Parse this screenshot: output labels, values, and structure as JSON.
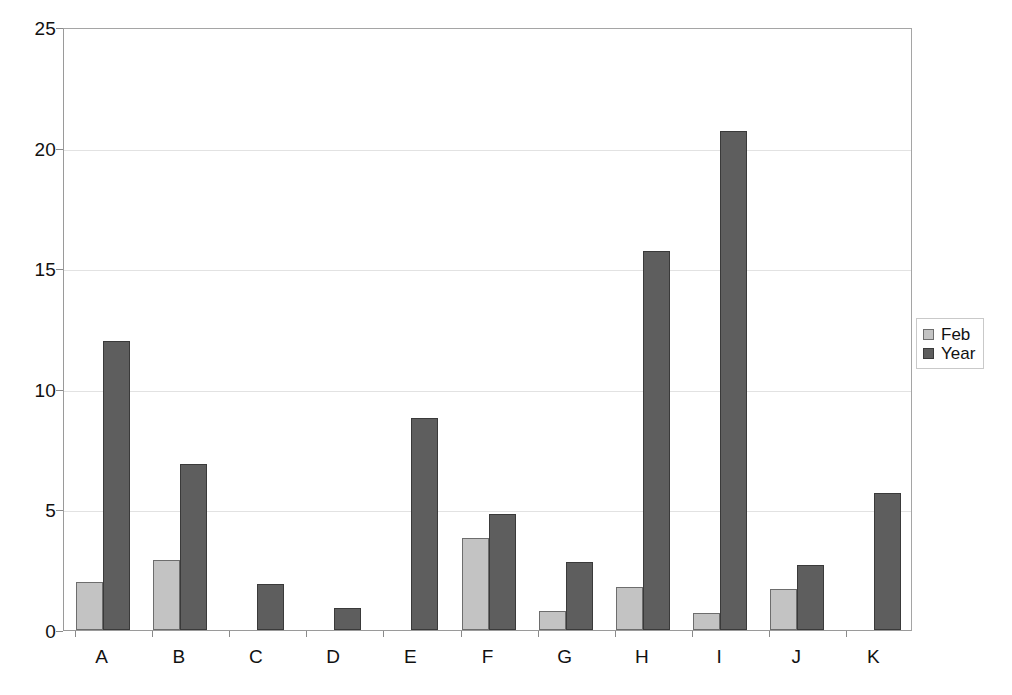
{
  "chart_data": {
    "type": "bar",
    "title": "",
    "xlabel": "",
    "ylabel": "",
    "categories": [
      "A",
      "B",
      "C",
      "D",
      "E",
      "F",
      "G",
      "H",
      "I",
      "J",
      "K"
    ],
    "series": [
      {
        "name": "Feb",
        "color": "#c3c3c3",
        "values": [
          2.0,
          2.9,
          null,
          null,
          null,
          3.8,
          0.8,
          1.8,
          0.7,
          1.7,
          null
        ]
      },
      {
        "name": "Year",
        "color": "#5e5e5e",
        "values": [
          12.0,
          6.9,
          1.9,
          0.9,
          8.8,
          4.8,
          2.8,
          15.7,
          20.7,
          2.7,
          5.7
        ]
      }
    ],
    "ylim": [
      0,
      25
    ],
    "yticks": [
      0,
      5,
      10,
      15,
      20,
      25
    ],
    "ytick_labels": [
      "0",
      "5",
      "10",
      "15",
      "20",
      "25"
    ],
    "grid": true,
    "grid_axis": "y",
    "legend_position": "right",
    "legend_entries": [
      "Feb",
      "Year"
    ]
  },
  "legend": {
    "items": [
      {
        "label": "Feb",
        "swatch": "feb"
      },
      {
        "label": "Year",
        "swatch": "year"
      }
    ]
  }
}
